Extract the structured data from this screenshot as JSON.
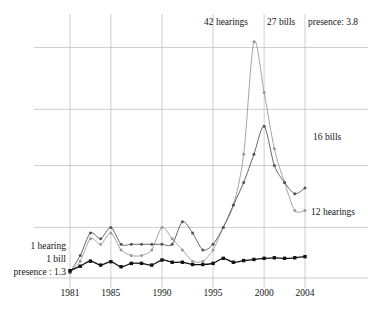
{
  "chart_data": {
    "type": "line",
    "title": "",
    "xlabel": "",
    "ylabel": "",
    "xlim": [
      1980.1,
      2004.5
    ],
    "ylim": [
      0,
      45
    ],
    "grid": true,
    "grid_x_values": [
      1981,
      1985,
      1990,
      1995,
      2000,
      2004
    ],
    "grid_y_values": [
      0,
      9,
      20,
      30,
      41
    ],
    "legend_position": "inline-endpoint-labels",
    "x": [
      1981,
      1982,
      1983,
      1984,
      1985,
      1986,
      1987,
      1988,
      1989,
      1990,
      1991,
      1992,
      1993,
      1994,
      1995,
      1996,
      1997,
      1998,
      1999,
      2000,
      2001,
      2002,
      2003,
      2004
    ],
    "series": [
      {
        "name": "hearings",
        "color": "#9a9a9a",
        "marker": "dot",
        "start_label": "1 hearing",
        "end_label": "12 hearings",
        "peak_label": "42 hearings",
        "peak_year": 1999,
        "values": [
          1,
          3,
          7,
          6,
          8,
          5,
          4,
          4,
          5,
          9,
          7,
          5,
          3,
          3,
          5,
          9,
          13,
          22,
          42,
          33,
          23,
          17,
          12,
          12
        ]
      },
      {
        "name": "bills",
        "color": "#555555",
        "marker": "dot",
        "start_label": "1 bill",
        "end_label": "16 bills",
        "peak_label": "27 bills",
        "peak_year": 2000,
        "values": [
          1,
          4,
          8,
          7,
          9,
          6,
          6,
          6,
          6,
          6,
          6,
          10,
          8,
          5,
          6,
          9,
          13,
          17,
          22,
          27,
          20,
          17,
          15,
          16
        ]
      },
      {
        "name": "presence",
        "color": "#111111",
        "marker": "square",
        "start_label": "presence : 1.3",
        "end_label": "presence: 3.8",
        "values": [
          1.3,
          2.1,
          3.0,
          2.3,
          2.9,
          2.0,
          2.6,
          2.6,
          2.3,
          3.2,
          2.8,
          2.8,
          2.4,
          2.4,
          2.6,
          3.5,
          2.8,
          3.1,
          3.3,
          3.5,
          3.6,
          3.5,
          3.6,
          3.8
        ]
      }
    ],
    "annotations": [
      {
        "text": "42 hearings",
        "position": "top-left-of-peak"
      },
      {
        "text": "27 bills",
        "position": "top-center"
      },
      {
        "text": "presence: 3.8",
        "position": "top-right"
      },
      {
        "text": "16 bills",
        "position": "right-middle"
      },
      {
        "text": "12 hearings",
        "position": "right-lower"
      },
      {
        "text": "1 hearing",
        "position": "left-lower"
      },
      {
        "text": "1 bill",
        "position": "left-lower"
      },
      {
        "text": "presence : 1.3",
        "position": "left-bottom"
      }
    ],
    "xtick_labels": [
      "1981",
      "1985",
      "1990",
      "1995",
      "2000",
      "2004"
    ]
  },
  "labels": {
    "peak_hearings": "42 hearings",
    "peak_bills": "27 bills",
    "end_presence": "presence: 3.8",
    "end_bills": "16 bills",
    "end_hearings": "12 hearings",
    "start_hearings": "1 hearing",
    "start_bills": "1 bill",
    "start_presence": "presence : 1.3"
  },
  "axis": {
    "ticks": [
      {
        "label": "1981"
      },
      {
        "label": "1985"
      },
      {
        "label": "1990"
      },
      {
        "label": "1995"
      },
      {
        "label": "2000"
      },
      {
        "label": "2004"
      }
    ]
  },
  "colors": {
    "grid": "#b9b9b9",
    "hearings": "#9a9a9a",
    "bills": "#555555",
    "presence": "#111111",
    "text": "#141414",
    "background": "#ffffff"
  }
}
